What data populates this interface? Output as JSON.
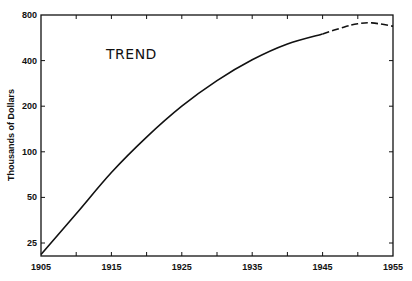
{
  "chart_data": {
    "type": "line",
    "title": "TREND",
    "xlabel": "",
    "ylabel": "Thousands of Dollars",
    "yscale": "log",
    "xlim": [
      1905,
      1955
    ],
    "ylim": [
      20,
      800
    ],
    "grid": false,
    "legend": null,
    "x_ticks": [
      1905,
      1910,
      1915,
      1920,
      1925,
      1930,
      1935,
      1940,
      1945,
      1950,
      1955
    ],
    "x_tick_labels": [
      "1905",
      "1915",
      "1925",
      "1935",
      "1945",
      "1955"
    ],
    "y_ticks": [
      25,
      50,
      100,
      200,
      400,
      800
    ],
    "y_tick_labels": [
      "25",
      "50",
      "100",
      "200",
      "400",
      "800"
    ],
    "series": [
      {
        "name": "Trend (solid)",
        "style": "solid",
        "x": [
          1905,
          1910,
          1915,
          1920,
          1925,
          1930,
          1935,
          1940,
          1945
        ],
        "values": [
          21,
          39,
          73,
          125,
          200,
          295,
          405,
          515,
          600
        ]
      },
      {
        "name": "Trend (projected, dashed)",
        "style": "dashed",
        "x": [
          1945,
          1948,
          1950,
          1952,
          1955
        ],
        "values": [
          600,
          665,
          700,
          710,
          675
        ]
      }
    ],
    "annotations": [
      {
        "text": "TREND",
        "x": 1910,
        "y": 500
      }
    ]
  }
}
